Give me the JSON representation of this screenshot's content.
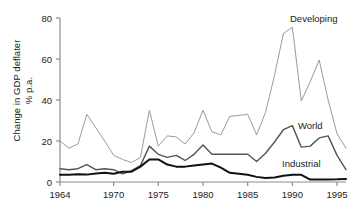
{
  "chart_data": {
    "type": "line",
    "title": "",
    "subtitle": "",
    "xlabel": "",
    "ylabel": "Change in GDP deflater\n% p.a.",
    "ylabel_line1": "Change in GDP deflater",
    "ylabel_line2": "% p.a.",
    "xlim": [
      1964,
      1996
    ],
    "ylim": [
      0,
      80
    ],
    "yticks": [
      0,
      20,
      40,
      60,
      80
    ],
    "ytick_labels": [
      "0",
      "20",
      "40",
      "60",
      "80"
    ],
    "xticks": [
      1964,
      1970,
      1975,
      1980,
      1985,
      1990,
      1995
    ],
    "xtick_labels": [
      "1964",
      "1970",
      "1975",
      "1980",
      "1985",
      "1990",
      "1995"
    ],
    "grid": false,
    "legend_position": "inline-right",
    "x": [
      1964,
      1965,
      1966,
      1967,
      1968,
      1969,
      1970,
      1971,
      1972,
      1973,
      1974,
      1975,
      1976,
      1977,
      1978,
      1979,
      1980,
      1981,
      1982,
      1983,
      1984,
      1985,
      1986,
      1987,
      1988,
      1989,
      1990,
      1991,
      1992,
      1993,
      1994,
      1995,
      1996
    ],
    "series": [
      {
        "name": "Developing",
        "color": "#9a9a9a",
        "width": 1.0,
        "label": "Developing",
        "values": [
          20.0,
          16.5,
          18.5,
          33.0,
          26.5,
          20.0,
          13.0,
          11.0,
          9.5,
          12.0,
          35.0,
          17.5,
          22.5,
          22.0,
          18.5,
          24.0,
          35.0,
          24.5,
          23.0,
          32.0,
          32.5,
          33.0,
          23.0,
          34.0,
          52.0,
          72.5,
          75.5,
          39.5,
          49.0,
          59.5,
          40.0,
          23.5,
          16.5
        ]
      },
      {
        "name": "World",
        "color": "#555555",
        "width": 1.4,
        "label": "World",
        "values": [
          6.5,
          6.0,
          6.5,
          8.5,
          6.0,
          6.5,
          6.0,
          4.0,
          5.5,
          8.0,
          17.5,
          13.5,
          12.0,
          13.0,
          10.5,
          13.5,
          18.0,
          13.5,
          13.5,
          13.5,
          13.5,
          13.5,
          10.0,
          14.0,
          19.5,
          25.5,
          27.5,
          17.0,
          17.5,
          21.5,
          22.5,
          13.0,
          6.0
        ]
      },
      {
        "name": "Industrial",
        "color": "#111111",
        "width": 2.0,
        "label": "Industrial",
        "values": [
          3.5,
          3.5,
          3.8,
          3.6,
          4.2,
          4.5,
          4.0,
          5.0,
          5.0,
          7.5,
          11.0,
          11.0,
          8.5,
          7.5,
          7.5,
          8.0,
          8.5,
          9.0,
          7.0,
          4.5,
          4.0,
          3.5,
          2.5,
          2.0,
          2.2,
          3.0,
          3.5,
          3.5,
          1.2,
          1.2,
          1.2,
          1.3,
          1.5
        ]
      }
    ],
    "annotations": [
      {
        "name": "developing-label",
        "text": "Developing"
      },
      {
        "name": "world-label",
        "text": "World"
      },
      {
        "name": "industrial-label",
        "text": "Industrial"
      }
    ],
    "axis_color": "#8b8b8b"
  }
}
